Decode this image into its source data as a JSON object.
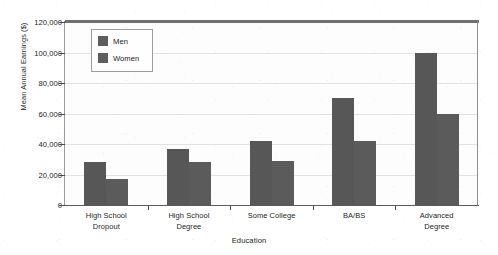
{
  "chart_data": {
    "type": "bar",
    "title": "",
    "xlabel": "Education",
    "ylabel": "Mean Annual Earnings ($)",
    "categories": [
      "High School\nDropout",
      "High School\nDegree",
      "Some College",
      "BA/BS",
      "Advanced\nDegree"
    ],
    "series": [
      {
        "name": "Men",
        "values": [
          28000,
          37000,
          42000,
          70000,
          100000
        ],
        "color": "#575757"
      },
      {
        "name": "Women",
        "values": [
          17000,
          28000,
          29000,
          42000,
          60000
        ],
        "color": "#5b5b5b"
      }
    ],
    "ylim": [
      0,
      120000
    ],
    "ytick_values": [
      0,
      20000,
      40000,
      60000,
      80000,
      100000,
      120000
    ],
    "ytick_labels": [
      "0",
      "20,000",
      "40,000",
      "60,000",
      "80,000",
      "100,000",
      "120,000"
    ],
    "grid": true,
    "legend_position": "upper left (inside plot)",
    "legend_entries": [
      "Men",
      "Women"
    ]
  },
  "axes": {
    "y_title": "Mean Annual Earnings ($)",
    "x_title": "Education"
  },
  "legend": {
    "items": [
      {
        "label": "Men"
      },
      {
        "label": "Women"
      }
    ]
  }
}
